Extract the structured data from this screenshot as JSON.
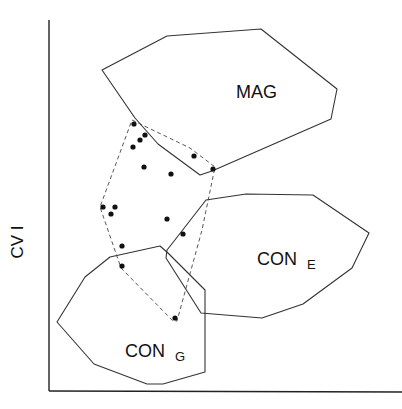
{
  "diagram": {
    "axes": {
      "y_label": "CV I",
      "x_label": ""
    },
    "regions": [
      {
        "id": "mag",
        "label": "MAG",
        "subscript": ""
      },
      {
        "id": "con-e",
        "label": "CON",
        "subscript": "E"
      },
      {
        "id": "con-g",
        "label": "CON",
        "subscript": "G"
      }
    ],
    "hull": {
      "style": "dashed",
      "point_count": 17
    }
  }
}
